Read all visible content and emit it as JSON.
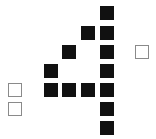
{
  "colors": {
    "filled": "#111111",
    "empty_border": "#8a8a8a",
    "background": "#ffffff"
  },
  "cell_size": 14,
  "digit_shape": "4",
  "filled_cells": [
    {
      "x": 100,
      "y": 6
    },
    {
      "x": 81,
      "y": 26
    },
    {
      "x": 100,
      "y": 26
    },
    {
      "x": 62,
      "y": 45
    },
    {
      "x": 100,
      "y": 45
    },
    {
      "x": 44,
      "y": 64
    },
    {
      "x": 100,
      "y": 64
    },
    {
      "x": 44,
      "y": 83
    },
    {
      "x": 62,
      "y": 83
    },
    {
      "x": 81,
      "y": 83
    },
    {
      "x": 100,
      "y": 83
    },
    {
      "x": 100,
      "y": 102
    },
    {
      "x": 100,
      "y": 121
    }
  ],
  "empty_cells": [
    {
      "x": 135,
      "y": 45
    },
    {
      "x": 8,
      "y": 83
    },
    {
      "x": 8,
      "y": 102
    }
  ]
}
